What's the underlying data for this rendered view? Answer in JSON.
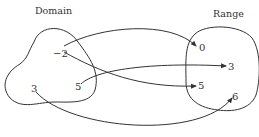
{
  "diagram": {
    "type": "mapping-diagram",
    "domain": {
      "title": "Domain",
      "elements": [
        {
          "label": "−2",
          "x": 58,
          "y": 54
        },
        {
          "label": "5",
          "x": 77,
          "y": 87
        },
        {
          "label": "3",
          "x": 33,
          "y": 89
        }
      ]
    },
    "range": {
      "title": "Range",
      "elements": [
        {
          "label": "0",
          "x": 202,
          "y": 50
        },
        {
          "label": "3",
          "x": 230,
          "y": 70
        },
        {
          "label": "5",
          "x": 199,
          "y": 89
        },
        {
          "label": "6",
          "x": 234,
          "y": 101
        }
      ]
    },
    "mappings": [
      {
        "from": "−2",
        "to": "0"
      },
      {
        "from": "−2",
        "to": "5"
      },
      {
        "from": "5",
        "to": "3"
      },
      {
        "from": "3",
        "to": "6"
      }
    ],
    "stroke_color": "#333333"
  }
}
